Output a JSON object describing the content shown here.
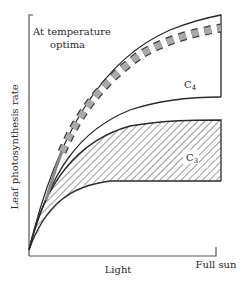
{
  "figure": {
    "annotation_line1": "At temperature",
    "annotation_line2": "optima",
    "y_axis_label": "Leaf photosynthesis rate",
    "x_axis_label": "Light",
    "x_axis_end_label": "Full sun",
    "regions": [
      {
        "name": "C4",
        "label_main": "C",
        "label_sub": "4",
        "fill": "none"
      },
      {
        "name": "C3",
        "label_main": "C",
        "label_sub": "3",
        "fill": "diagonal-hatch"
      }
    ],
    "colors": {
      "line": "#2a2a2a",
      "dash_fill": "#a9a9a9",
      "dash_outline": "#3a3a3a",
      "background": "#ffffff"
    }
  }
}
